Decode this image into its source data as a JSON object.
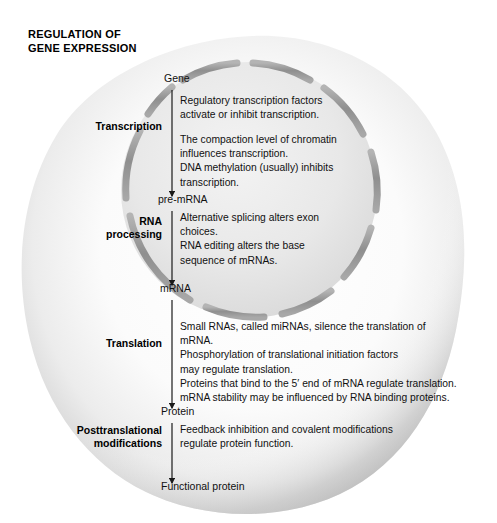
{
  "title": "REGULATION OF\nGENE EXPRESSION",
  "colors": {
    "cell_fill_light": "#fdfdfd",
    "cell_fill_shadow": "#d2d2d2",
    "nucleus_fill": "#e9e9e9",
    "nuclear_envelope": "#9a9a9a",
    "arrow": "#1a1a1a",
    "text": "#111111"
  },
  "diagram": {
    "type": "flow-diagram",
    "cell_name": "eukaryotic-cell",
    "nucleus_name": "nucleus",
    "nuclear_envelope_name": "nuclear-envelope-with-pores",
    "nodes": [
      {
        "id": "gene",
        "label": "Gene",
        "x": 164,
        "y": 78,
        "inside_nucleus": true
      },
      {
        "id": "pre-mrna",
        "label": "pre-mRNA",
        "x": 158,
        "y": 199,
        "inside_nucleus": true
      },
      {
        "id": "mrna",
        "label": "mRNA",
        "x": 160,
        "y": 288,
        "inside_nucleus": false
      },
      {
        "id": "protein",
        "label": "Protein",
        "x": 161,
        "y": 411,
        "inside_nucleus": false
      },
      {
        "id": "functional-protein",
        "label": "Functional protein",
        "x": 161,
        "y": 486,
        "inside_nucleus": false
      }
    ],
    "stages": [
      {
        "id": "transcription",
        "label": "Transcription",
        "label_x": 100,
        "label_y": 120,
        "arrow_top": 90,
        "arrow_bottom": 196,
        "details": [
          "Regulatory transcription factors\nactivate or inhibit transcription.",
          "The compaction level of chromatin\ninfluences transcription.\nDNA methylation (usually) inhibits\ntranscription."
        ],
        "details_x": 180,
        "details_y": 96
      },
      {
        "id": "rna-processing",
        "label": "RNA\nprocessing",
        "label_x": 100,
        "label_y": 222,
        "arrow_top": 211,
        "arrow_bottom": 285,
        "details": [
          "Alternative splicing alters exon\nchoices.\nRNA editing alters the base\nsequence of mRNAs."
        ],
        "details_x": 180,
        "details_y": 213
      },
      {
        "id": "translation",
        "label": "Translation",
        "label_x": 100,
        "label_y": 337,
        "arrow_top": 300,
        "arrow_bottom": 408,
        "details": [
          "Small RNAs, called miRNAs, silence the translation of\nmRNA.\nPhosphorylation of translational initiation factors\nmay regulate translation.\nProteins that bind to the 5′ end of mRNA regulate translation.\nmRNA stability may be influenced by RNA binding proteins."
        ],
        "details_x": 180,
        "details_y": 323
      },
      {
        "id": "posttranslational-modifications",
        "label": "Posttranslational\nmodifications",
        "label_x": 28,
        "label_y": 427,
        "arrow_top": 423,
        "arrow_bottom": 483,
        "details": [
          "Feedback inhibition and covalent modifications\nregulate protein function."
        ],
        "details_x": 180,
        "details_y": 425
      }
    ]
  }
}
